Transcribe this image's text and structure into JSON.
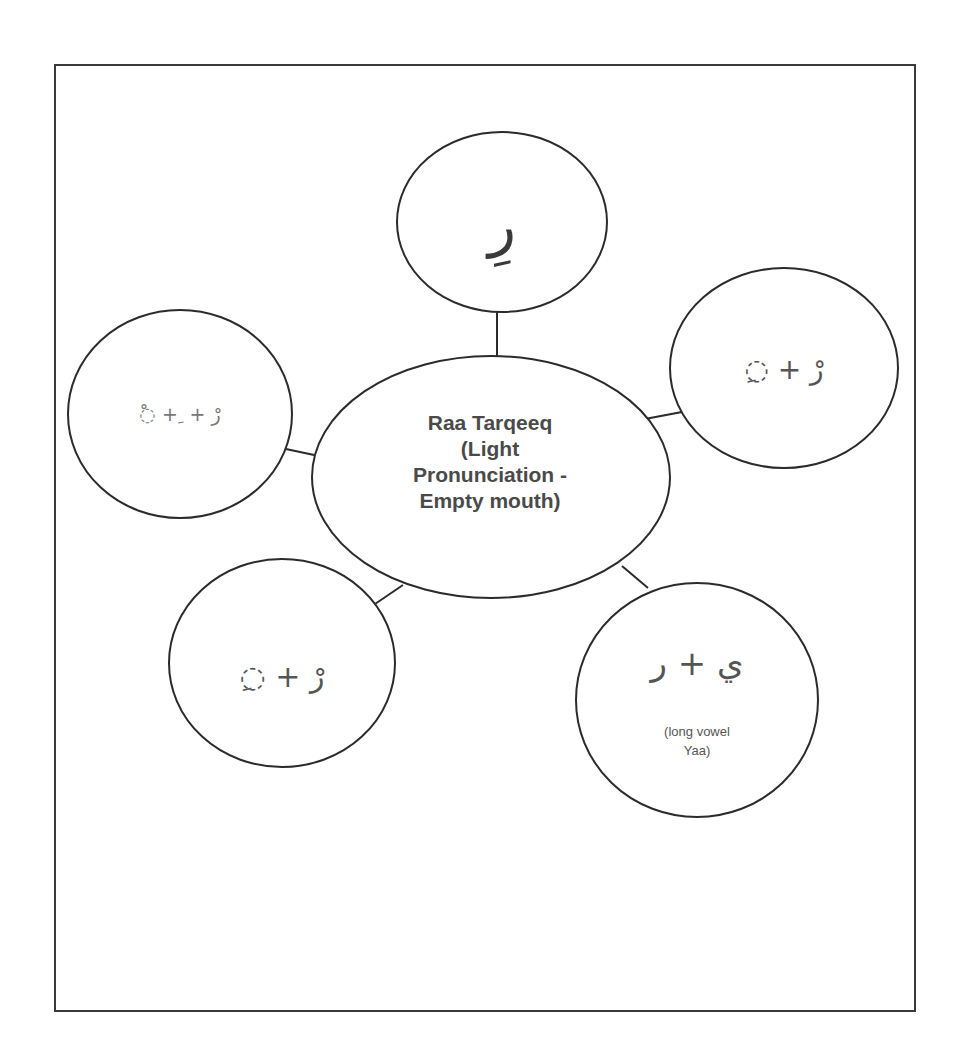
{
  "diagram": {
    "type": "spider-map",
    "style": {
      "stroke": "#2b2b2b",
      "text": "#555555",
      "background": "#ffffff"
    },
    "center": {
      "label": "Raa Tarqeeq (Light Pronunciation - Empty mouth)",
      "lines": [
        "Raa Tarqeeq",
        "(Light",
        "Pronunciation -",
        "Empty mouth)"
      ]
    },
    "nodes": [
      {
        "id": "top",
        "text": "رِ"
      },
      {
        "id": "right",
        "text": "◌ِ + رْ"
      },
      {
        "id": "left",
        "text": "◌ْ + ِ + رْ"
      },
      {
        "id": "bottom-left",
        "text": "◌ِ + رْ"
      },
      {
        "id": "bottom-right",
        "text": "ي + ر",
        "note_lines": [
          "(long vowel",
          "Yaa)"
        ]
      }
    ]
  }
}
